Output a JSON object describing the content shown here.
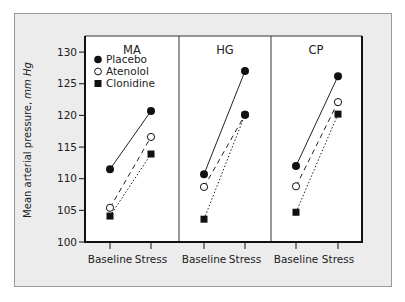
{
  "chart_data": {
    "type": "line",
    "ylabel": "Mean arterial pressure, mm Hg",
    "ylim": [
      100,
      130
    ],
    "yticks": [
      100,
      105,
      110,
      115,
      120,
      125,
      130
    ],
    "categories": [
      "Baseline",
      "Stress"
    ],
    "legend": [
      {
        "name": "Placebo",
        "marker": "filled-circle",
        "line": "solid"
      },
      {
        "name": "Atenolol",
        "marker": "open-circle",
        "line": "dashed"
      },
      {
        "name": "Clonidine",
        "marker": "filled-square",
        "line": "dotted"
      }
    ],
    "legend_position": "top-left of first panel",
    "grid": false,
    "panels": [
      {
        "title": "MA",
        "series": [
          {
            "name": "Placebo",
            "values": [
              111.5,
              120.7
            ]
          },
          {
            "name": "Atenolol",
            "values": [
              105.4,
              116.6
            ]
          },
          {
            "name": "Clonidine",
            "values": [
              104.1,
              113.9
            ]
          }
        ]
      },
      {
        "title": "HG",
        "series": [
          {
            "name": "Placebo",
            "values": [
              110.7,
              127.0
            ]
          },
          {
            "name": "Atenolol",
            "values": [
              108.7,
              120.1
            ]
          },
          {
            "name": "Clonidine",
            "values": [
              103.6,
              120.1
            ]
          }
        ]
      },
      {
        "title": "CP",
        "series": [
          {
            "name": "Placebo",
            "values": [
              112.0,
              126.2
            ]
          },
          {
            "name": "Atenolol",
            "values": [
              108.8,
              122.1
            ]
          },
          {
            "name": "Clonidine",
            "values": [
              104.7,
              120.2
            ]
          }
        ]
      }
    ]
  },
  "labels": {
    "ylabel_main": "Mean arterial pressure, ",
    "ylabel_unit": "mm Hg",
    "yticks": [
      "100",
      "105",
      "110",
      "115",
      "120",
      "125",
      "130"
    ],
    "xcat_baseline": "Baseline",
    "xcat_stress": "Stress",
    "panel_titles": [
      "MA",
      "HG",
      "CP"
    ],
    "legend": [
      "Placebo",
      "Atenolol",
      "Clonidine"
    ]
  },
  "colors": {
    "card_bg": "#ececec",
    "plot_bg": "#ffffff",
    "ink": "#111111"
  }
}
